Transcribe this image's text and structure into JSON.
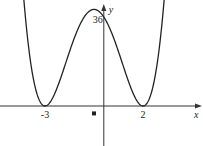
{
  "chart_data": {
    "type": "line",
    "title": "",
    "xlabel": "x",
    "ylabel": "y",
    "function": "y = (x+3)^2 (x-2)^2",
    "x_ticks": [
      {
        "value": -3,
        "label": "-3"
      },
      {
        "value": 2,
        "label": "2"
      }
    ],
    "y_ticks": [
      {
        "value": 36,
        "label": "36"
      }
    ],
    "xlim": [
      -4.3,
      3.9
    ],
    "ylim": [
      -20,
      40
    ],
    "series": [
      {
        "name": "curve",
        "x_range": [
          -4.15,
          3.3
        ],
        "points": "sampled from (x+3)^2 (x-2)^2"
      }
    ],
    "marker": {
      "x": -0.5,
      "y": -3,
      "shape": "square"
    },
    "grid": false,
    "legend": "none"
  }
}
